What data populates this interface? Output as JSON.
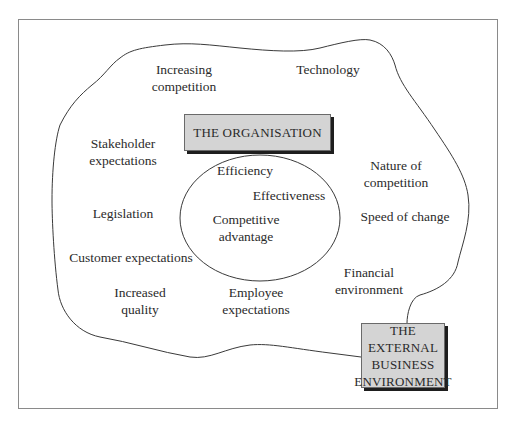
{
  "diagram": {
    "type": "context-diagram",
    "colors": {
      "frame": "#8a8a8a",
      "line": "#3a3a3a",
      "box_fill": "#d4d4d4",
      "box_shadow": "#1e1e1e",
      "text": "#2b2b2b"
    },
    "organisation_box": {
      "label": "THE ORGANISATION"
    },
    "external_box": {
      "lines": [
        "THE EXTERNAL",
        "BUSINESS",
        "ENVIRONMENT"
      ]
    },
    "internal_factors": [
      {
        "id": "efficiency",
        "lines": [
          "Efficiency"
        ]
      },
      {
        "id": "effectiveness",
        "lines": [
          "Effectiveness"
        ]
      },
      {
        "id": "competitive-advantage",
        "lines": [
          "Competitive",
          "advantage"
        ]
      }
    ],
    "external_factors": [
      {
        "id": "increasing-competition",
        "lines": [
          "Increasing",
          "competition"
        ]
      },
      {
        "id": "technology",
        "lines": [
          "Technology"
        ]
      },
      {
        "id": "stakeholder-expectations",
        "lines": [
          "Stakeholder",
          "expectations"
        ]
      },
      {
        "id": "nature-of-competition",
        "lines": [
          "Nature of",
          "competition"
        ]
      },
      {
        "id": "legislation",
        "lines": [
          "Legislation"
        ]
      },
      {
        "id": "speed-of-change",
        "lines": [
          "Speed of change"
        ]
      },
      {
        "id": "customer-expectations",
        "lines": [
          "Customer expectations"
        ]
      },
      {
        "id": "financial-environment",
        "lines": [
          "Financial",
          "environment"
        ]
      },
      {
        "id": "increased-quality",
        "lines": [
          "Increased",
          "quality"
        ]
      },
      {
        "id": "employee-expectations",
        "lines": [
          "Employee",
          "expectations"
        ]
      }
    ]
  }
}
